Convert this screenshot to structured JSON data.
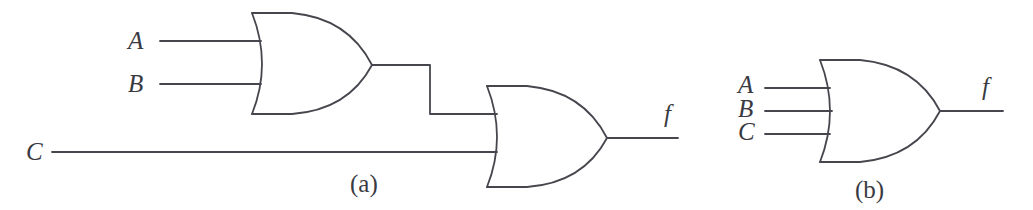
{
  "figure": {
    "background_color": "#ffffff",
    "line_color": "#46464e",
    "text_color": "#3a3a42",
    "subfigures": [
      {
        "caption": "(a)",
        "caption_x": 350,
        "caption_y": 171,
        "description": "Two-level OR network: A and B into a 2-input OR gate, whose output joins C at a second 2-input OR gate producing f",
        "gates": [
          {
            "name": "or-gate-a1",
            "type": "OR",
            "inputs": [
              "A",
              "B"
            ],
            "output": "or1-out"
          },
          {
            "name": "or-gate-a2",
            "type": "OR",
            "inputs": [
              "or1-out",
              "C"
            ],
            "output": "f"
          }
        ],
        "input_labels": [
          {
            "text": "A",
            "x": 128,
            "y": 28
          },
          {
            "text": "B",
            "x": 128,
            "y": 71
          },
          {
            "text": "C",
            "x": 26,
            "y": 139
          }
        ],
        "output_labels": [
          {
            "text": "f",
            "x": 664,
            "y": 101
          }
        ]
      },
      {
        "caption": "(b)",
        "caption_x": 855,
        "caption_y": 177,
        "description": "Equivalent single 3-input OR gate with inputs A, B and C producing f",
        "gates": [
          {
            "name": "or-gate-b1",
            "type": "OR",
            "inputs": [
              "A",
              "B",
              "C"
            ],
            "output": "f"
          }
        ],
        "input_labels": [
          {
            "text": "A",
            "x": 738,
            "y": 72
          },
          {
            "text": "B",
            "x": 738,
            "y": 96
          },
          {
            "text": "C",
            "x": 738,
            "y": 119
          }
        ],
        "output_labels": [
          {
            "text": "f",
            "x": 982,
            "y": 74
          }
        ]
      }
    ]
  }
}
